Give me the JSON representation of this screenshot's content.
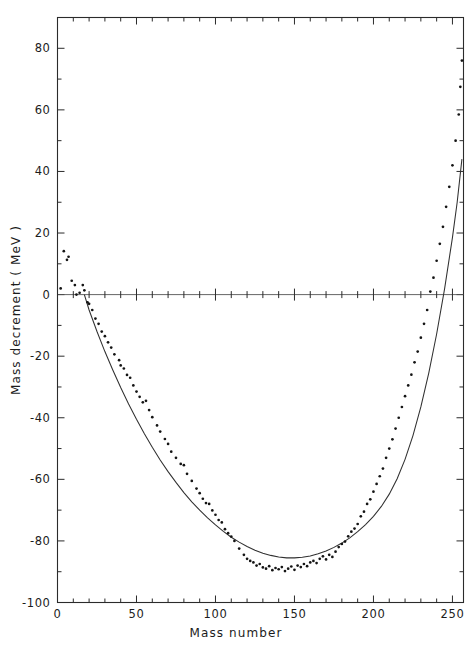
{
  "figure": {
    "background_color": "#ffffff",
    "ink_color": "#1c1c1c"
  },
  "axes": {
    "x_title": "Mass  number",
    "y_title": "Mass  decrement   ( MeV )",
    "x_tick_labels": [
      "0",
      "50",
      "100",
      "150",
      "200",
      "250"
    ],
    "y_tick_labels": [
      "80",
      "60",
      "40",
      "20",
      "0",
      "-20",
      "-40",
      "-60",
      "-80",
      "-100"
    ]
  },
  "chart_data": {
    "type": "scatter",
    "title": "",
    "subtitle": "",
    "xlabel": "Mass number",
    "ylabel": "Mass decrement (MeV)",
    "xlim": [
      0,
      257
    ],
    "ylim": [
      -100,
      90
    ],
    "xticks": [
      0,
      50,
      100,
      150,
      200,
      250
    ],
    "yticks": [
      -100,
      -80,
      -60,
      -40,
      -20,
      0,
      20,
      40,
      60,
      80
    ],
    "x_minor_tick_step": 10,
    "y_minor_tick_step": 10,
    "grid": false,
    "legend": null,
    "legend_position": "none",
    "zero_line": true,
    "series": [
      {
        "name": "Experimental mass decrement",
        "type": "scatter",
        "marker": "dot",
        "color": "#141414",
        "points": [
          [
            2,
            2.0
          ],
          [
            4,
            14.1
          ],
          [
            6,
            11.3
          ],
          [
            7,
            12.3
          ],
          [
            9,
            4.5
          ],
          [
            11,
            3.1
          ],
          [
            12,
            0.0
          ],
          [
            14,
            0.6
          ],
          [
            16,
            3.1
          ],
          [
            17,
            1.4
          ],
          [
            19,
            -2.5
          ],
          [
            20,
            -3.0
          ],
          [
            22,
            -5.0
          ],
          [
            24,
            -7.8
          ],
          [
            26,
            -9.5
          ],
          [
            28,
            -12.0
          ],
          [
            30,
            -13.5
          ],
          [
            32,
            -15.5
          ],
          [
            34,
            -17.2
          ],
          [
            36,
            -19.4
          ],
          [
            39,
            -21.3
          ],
          [
            40,
            -23.0
          ],
          [
            42,
            -24.0
          ],
          [
            44,
            -26.1
          ],
          [
            46,
            -27.0
          ],
          [
            48,
            -29.5
          ],
          [
            50,
            -31.5
          ],
          [
            52,
            -33.2
          ],
          [
            54,
            -35.0
          ],
          [
            56,
            -34.5
          ],
          [
            58,
            -37.5
          ],
          [
            60,
            -39.8
          ],
          [
            63,
            -42.5
          ],
          [
            65,
            -44.5
          ],
          [
            68,
            -46.9
          ],
          [
            70,
            -48.5
          ],
          [
            72,
            -51.0
          ],
          [
            75,
            -53.0
          ],
          [
            78,
            -55.0
          ],
          [
            80,
            -55.4
          ],
          [
            82,
            -58.2
          ],
          [
            85,
            -60.5
          ],
          [
            88,
            -63.0
          ],
          [
            90,
            -64.5
          ],
          [
            92,
            -66.3
          ],
          [
            94,
            -67.7
          ],
          [
            96,
            -68.0
          ],
          [
            98,
            -70.1
          ],
          [
            100,
            -71.5
          ],
          [
            102,
            -73.2
          ],
          [
            104,
            -74.0
          ],
          [
            106,
            -76.2
          ],
          [
            108,
            -77.5
          ],
          [
            110,
            -78.6
          ],
          [
            112,
            -80.0
          ],
          [
            115,
            -82.5
          ],
          [
            118,
            -84.5
          ],
          [
            120,
            -85.8
          ],
          [
            122,
            -86.5
          ],
          [
            124,
            -87.0
          ],
          [
            126,
            -88.0
          ],
          [
            128,
            -87.5
          ],
          [
            130,
            -88.6
          ],
          [
            132,
            -89.0
          ],
          [
            134,
            -88.2
          ],
          [
            136,
            -89.5
          ],
          [
            138,
            -88.8
          ],
          [
            140,
            -89.2
          ],
          [
            142,
            -88.5
          ],
          [
            144,
            -89.8
          ],
          [
            146,
            -89.0
          ],
          [
            148,
            -88.3
          ],
          [
            150,
            -89.4
          ],
          [
            152,
            -88.0
          ],
          [
            154,
            -88.5
          ],
          [
            156,
            -87.5
          ],
          [
            158,
            -88.2
          ],
          [
            160,
            -87.0
          ],
          [
            162,
            -86.5
          ],
          [
            164,
            -87.2
          ],
          [
            166,
            -85.8
          ],
          [
            168,
            -85.0
          ],
          [
            170,
            -86.0
          ],
          [
            172,
            -84.5
          ],
          [
            174,
            -85.2
          ],
          [
            176,
            -83.5
          ],
          [
            178,
            -82.0
          ],
          [
            180,
            -81.0
          ],
          [
            182,
            -80.2
          ],
          [
            184,
            -78.5
          ],
          [
            186,
            -77.0
          ],
          [
            188,
            -76.0
          ],
          [
            190,
            -74.5
          ],
          [
            192,
            -72.0
          ],
          [
            194,
            -70.5
          ],
          [
            196,
            -68.0
          ],
          [
            198,
            -66.5
          ],
          [
            200,
            -64.0
          ],
          [
            202,
            -61.5
          ],
          [
            204,
            -59.0
          ],
          [
            206,
            -56.5
          ],
          [
            208,
            -53.0
          ],
          [
            210,
            -50.0
          ],
          [
            212,
            -47.0
          ],
          [
            214,
            -43.5
          ],
          [
            216,
            -40.0
          ],
          [
            218,
            -36.5
          ],
          [
            220,
            -33.0
          ],
          [
            222,
            -29.5
          ],
          [
            224,
            -26.0
          ],
          [
            226,
            -22.0
          ],
          [
            228,
            -18.5
          ],
          [
            230,
            -14.0
          ],
          [
            232,
            -9.5
          ],
          [
            234,
            -5.0
          ],
          [
            236,
            1.0
          ],
          [
            238,
            5.5
          ],
          [
            240,
            11.0
          ],
          [
            242,
            16.5
          ],
          [
            244,
            22.0
          ],
          [
            246,
            28.5
          ],
          [
            248,
            35.0
          ],
          [
            250,
            42.0
          ],
          [
            252,
            50.0
          ],
          [
            254,
            58.5
          ],
          [
            255,
            67.5
          ],
          [
            256,
            76.0
          ]
        ]
      },
      {
        "name": "Semi-empirical mass formula fit",
        "type": "line",
        "color": "#303030",
        "points": [
          [
            17,
            0.0
          ],
          [
            20,
            -5.0
          ],
          [
            25,
            -12.0
          ],
          [
            30,
            -18.5
          ],
          [
            35,
            -24.5
          ],
          [
            40,
            -30.2
          ],
          [
            45,
            -35.5
          ],
          [
            50,
            -40.5
          ],
          [
            55,
            -45.2
          ],
          [
            60,
            -49.6
          ],
          [
            65,
            -53.7
          ],
          [
            70,
            -57.5
          ],
          [
            75,
            -61.0
          ],
          [
            80,
            -64.3
          ],
          [
            85,
            -67.3
          ],
          [
            90,
            -70.0
          ],
          [
            95,
            -72.5
          ],
          [
            100,
            -74.8
          ],
          [
            105,
            -76.9
          ],
          [
            110,
            -78.8
          ],
          [
            115,
            -80.4
          ],
          [
            120,
            -81.8
          ],
          [
            125,
            -83.0
          ],
          [
            130,
            -84.0
          ],
          [
            135,
            -84.7
          ],
          [
            140,
            -85.2
          ],
          [
            145,
            -85.5
          ],
          [
            150,
            -85.5
          ],
          [
            155,
            -85.3
          ],
          [
            160,
            -84.9
          ],
          [
            165,
            -84.2
          ],
          [
            170,
            -83.3
          ],
          [
            175,
            -82.1
          ],
          [
            180,
            -80.7
          ],
          [
            185,
            -79.0
          ],
          [
            190,
            -77.0
          ],
          [
            195,
            -74.7
          ],
          [
            200,
            -72.0
          ],
          [
            205,
            -68.8
          ],
          [
            210,
            -64.8
          ],
          [
            215,
            -59.8
          ],
          [
            220,
            -53.5
          ],
          [
            225,
            -45.8
          ],
          [
            230,
            -36.5
          ],
          [
            235,
            -25.5
          ],
          [
            240,
            -12.8
          ],
          [
            245,
            1.8
          ],
          [
            250,
            18.5
          ],
          [
            253,
            30.0
          ],
          [
            256,
            44.0
          ]
        ]
      }
    ]
  }
}
